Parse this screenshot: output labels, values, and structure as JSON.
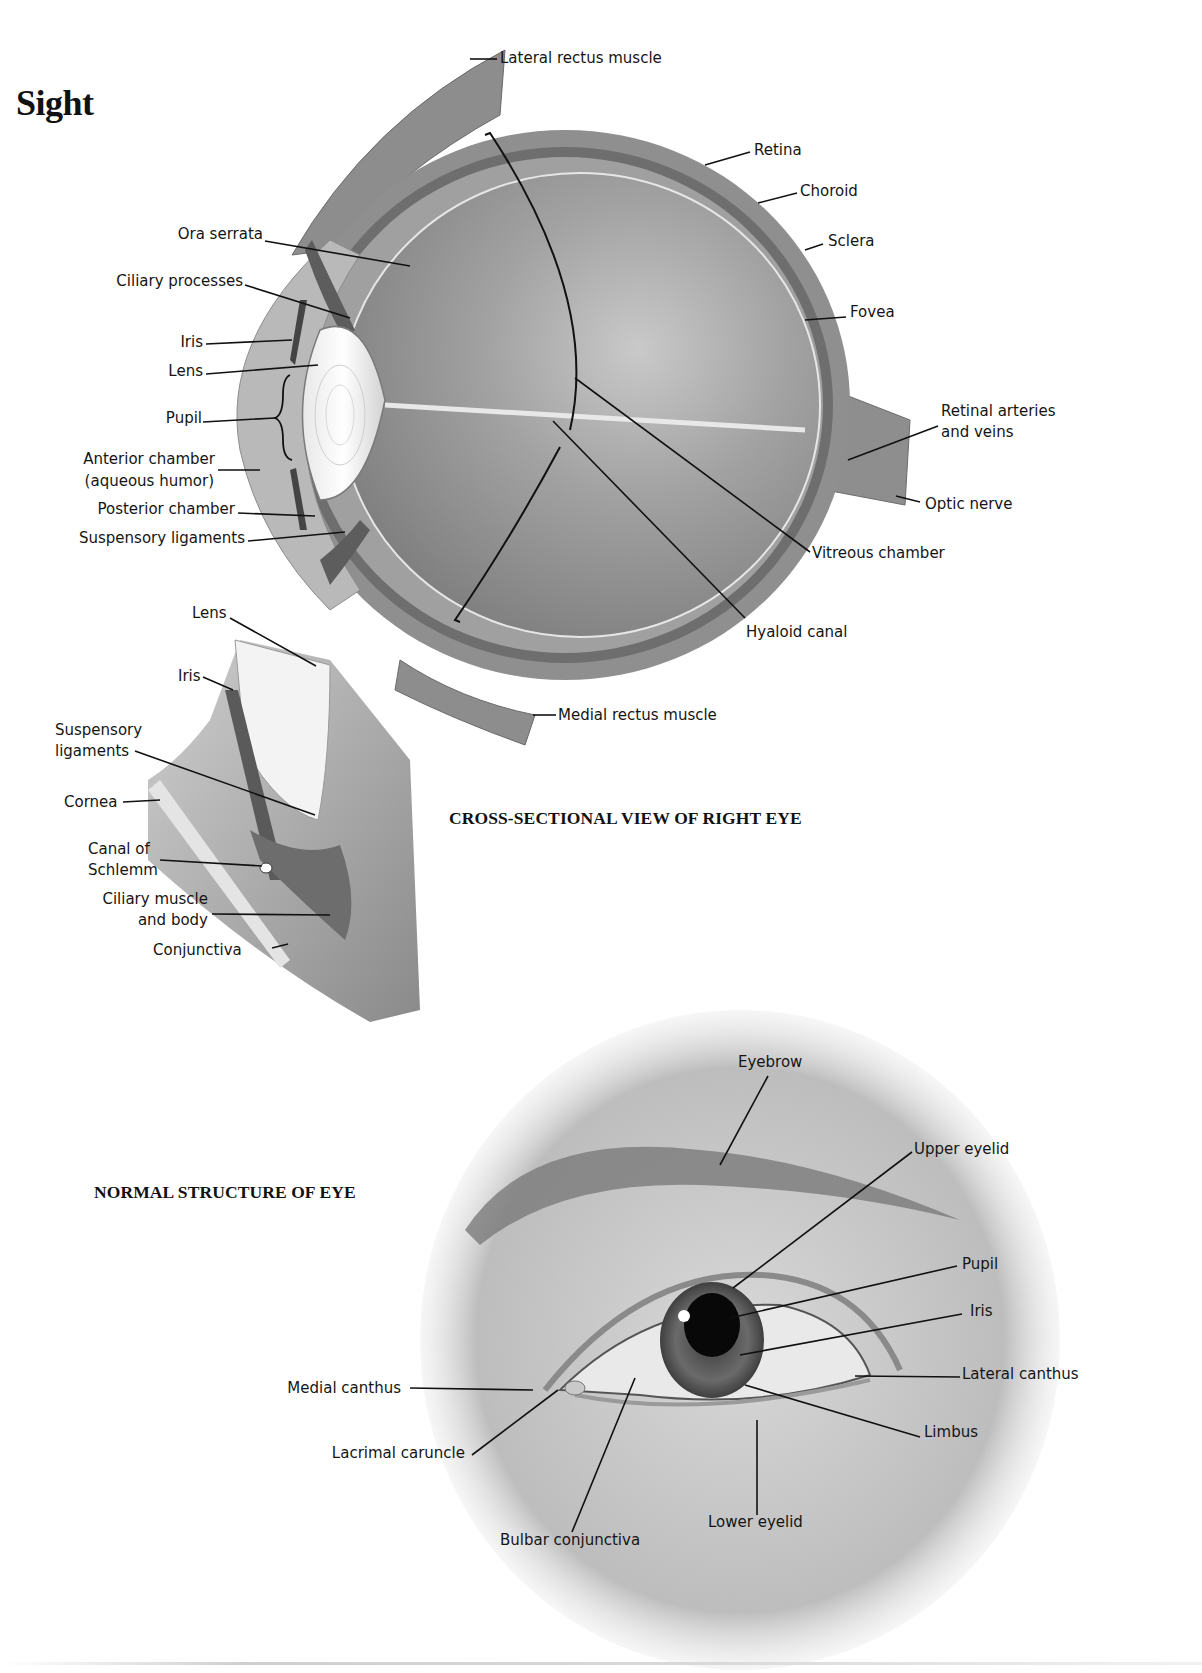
{
  "page": {
    "title": "Sight"
  },
  "cross_section": {
    "caption": "CROSS-SECTIONAL VIEW OF RIGHT EYE",
    "labels": {
      "lateral_rectus": "Lateral rectus muscle",
      "retina": "Retina",
      "choroid": "Choroid",
      "sclera": "Sclera",
      "fovea": "Fovea",
      "retinal_arteries_1": "Retinal arteries",
      "retinal_arteries_2": "and veins",
      "optic_nerve": "Optic nerve",
      "vitreous_chamber": "Vitreous chamber",
      "hyaloid_canal": "Hyaloid canal",
      "medial_rectus": "Medial rectus muscle",
      "ora_serrata": "Ora serrata",
      "ciliary_processes": "Ciliary processes",
      "iris": "Iris",
      "lens": "Lens",
      "pupil": "Pupil",
      "anterior_chamber_1": "Anterior chamber",
      "anterior_chamber_2": "(aqueous humor)",
      "posterior_chamber": "Posterior chamber",
      "suspensory_ligaments": "Suspensory ligaments"
    }
  },
  "detail_inset": {
    "labels": {
      "lens": "Lens",
      "iris": "Iris",
      "suspensory_1": "Suspensory",
      "suspensory_2": "ligaments",
      "cornea": "Cornea",
      "canal_1": "Canal of",
      "canal_2": "Schlemm",
      "ciliary_1": "Ciliary muscle",
      "ciliary_2": "and body",
      "conjunctiva": "Conjunctiva"
    }
  },
  "external_view": {
    "caption": "NORMAL STRUCTURE OF EYE",
    "labels": {
      "eyebrow": "Eyebrow",
      "upper_eyelid": "Upper eyelid",
      "pupil": "Pupil",
      "iris": "Iris",
      "lateral_canthus": "Lateral canthus",
      "limbus": "Limbus",
      "lower_eyelid": "Lower eyelid",
      "bulbar_conjunctiva": "Bulbar conjunctiva",
      "lacrimal_caruncle": "Lacrimal caruncle",
      "medial_canthus": "Medial canthus"
    }
  },
  "colors": {
    "sclera_gray": "#8f8f8f",
    "choroid_dark": "#6e6e6e",
    "vitreous_gray": "#9a9a9a",
    "leader_line": "#111111"
  }
}
